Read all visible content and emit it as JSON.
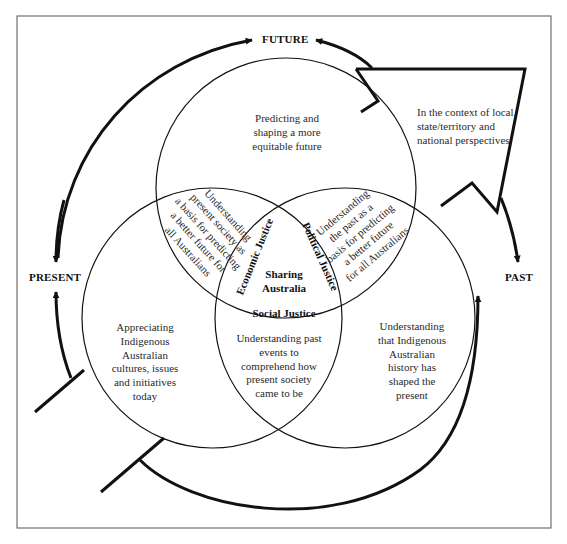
{
  "diagram": {
    "title_labels": {
      "future": "FUTURE",
      "present": "PRESENT",
      "past": "PAST"
    },
    "context_note": [
      "In the context of local,",
      "state/territory and",
      "national perspectives"
    ],
    "circles": {
      "top": [
        "Predicting and",
        "shaping a more",
        "equitable future"
      ],
      "left": [
        "Appreciating",
        "Indigenous",
        "Australian",
        "cultures, issues",
        "and initiatives",
        "today"
      ],
      "right": [
        "Understanding",
        "that Indigenous",
        "Australian",
        "history has",
        "shaped the",
        "present"
      ]
    },
    "overlaps": {
      "top_left": [
        "Understanding",
        "present society as",
        "a basis for predicting",
        "a better future for",
        "all Australians"
      ],
      "top_right": [
        "Understanding",
        "the past as a",
        "basis for predicting",
        "a better future",
        "for all Australians"
      ],
      "bottom": [
        "Understanding past",
        "events to",
        "comprehend how",
        "present society",
        "came to be"
      ]
    },
    "center": {
      "title": [
        "Sharing",
        "Australia"
      ],
      "economic": "Economic Justice",
      "political": "Political Justice",
      "social": "Social Justice"
    },
    "colors": {
      "line": "#111111",
      "frame": "#555555",
      "text": "#2a2a2a",
      "background": "#ffffff"
    }
  }
}
